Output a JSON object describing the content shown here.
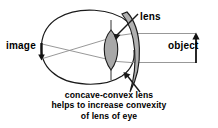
{
  "diagram": {
    "title_text": "concave-convex lens helps to increase convexity of lens of eye",
    "labels": {
      "image": "image",
      "lens": "lens",
      "object": "object"
    },
    "caption": {
      "line1": "concave-convex lens",
      "line2": "helps to increase convexity",
      "line3": "of lens of eye"
    },
    "colors": {
      "outline": "#1a1a1a",
      "ray": "#8c8c8c",
      "eye_lens_fill": "#a8a8a8",
      "corrective_lens_fill": "#b0b0b0",
      "background": "#ffffff",
      "text": "#000000"
    },
    "parts": {
      "eyeball": "eyeball-outline",
      "eye_lens": "eye-lens-shape",
      "corrective_lens": "concave-convex-lens-shape",
      "retina_image_arrow": "inverted-image-arrow",
      "object_arrow": "object-arrow",
      "rays": "light-ray-lines",
      "lens_pointer": "lens-label-pointer",
      "caption_pointer": "caption-pointer"
    }
  }
}
